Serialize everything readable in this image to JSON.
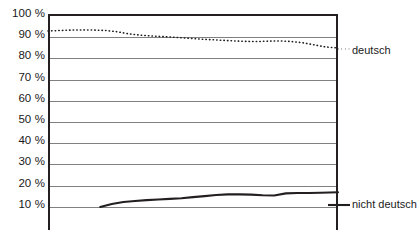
{
  "chart_data": {
    "type": "line",
    "title": "",
    "xlabel": "",
    "ylabel": "",
    "ylim": [
      0,
      100
    ],
    "y_ticks": [
      100,
      90,
      80,
      70,
      60,
      50,
      40,
      30,
      20,
      10
    ],
    "y_tick_labels": [
      "100 %",
      "90 %",
      "80 %",
      "70 %",
      "60 %",
      "50 %",
      "40 %",
      "30 %",
      "20 %",
      "10 %"
    ],
    "grid": true,
    "grid_axis": "y",
    "legend_position": "right",
    "x_tick_labels": [],
    "series": [
      {
        "name": "deutsch",
        "style": "dotted",
        "color": "#231f20",
        "x": [
          0,
          4,
          8,
          12,
          16,
          20,
          24,
          28,
          32,
          36,
          40,
          44,
          48,
          52,
          56,
          60,
          64,
          68,
          72,
          76,
          80,
          84,
          88,
          92,
          96,
          100
        ],
        "values": [
          92.0,
          92.2,
          92.4,
          92.5,
          92.4,
          92.2,
          91.6,
          90.6,
          90.0,
          89.6,
          89.3,
          89.0,
          88.6,
          88.2,
          87.9,
          87.6,
          87.3,
          87.1,
          87.0,
          87.2,
          87.3,
          87.0,
          86.4,
          85.4,
          84.4,
          84.0
        ]
      },
      {
        "name": "nicht deutsch",
        "style": "solid",
        "color": "#231f20",
        "x": [
          18,
          22,
          26,
          30,
          34,
          38,
          42,
          46,
          50,
          54,
          58,
          62,
          66,
          70,
          74,
          78,
          82,
          86,
          90,
          94,
          100
        ],
        "values": [
          9.0,
          10.4,
          11.3,
          11.8,
          12.2,
          12.5,
          12.8,
          13.1,
          13.6,
          14.1,
          14.6,
          14.9,
          14.9,
          14.8,
          14.5,
          14.4,
          15.4,
          15.6,
          15.6,
          15.7,
          15.9
        ]
      }
    ]
  },
  "legend": {
    "deutsch": "deutsch",
    "nicht_deutsch": "nicht deutsch"
  },
  "axis": {
    "y_labels": [
      "100 %",
      "90 %",
      "80 %",
      "70 %",
      "60 %",
      "50 %",
      "40 %",
      "30 %",
      "20 %",
      "10 %"
    ]
  },
  "colors": {
    "axis": "#231f20",
    "grid": "#808080",
    "series": "#231f20",
    "background": "#ffffff"
  }
}
